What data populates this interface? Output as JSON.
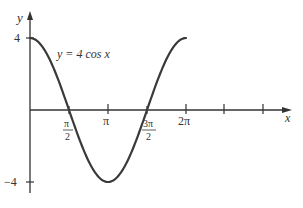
{
  "chart_data": {
    "type": "line",
    "title": "",
    "function_label": "y = 4 cos x",
    "xlabel": "x",
    "ylabel": "y",
    "xlim": [
      0,
      8.64
    ],
    "ylim": [
      -4.6,
      5.4
    ],
    "x_ticks": [
      {
        "value": 1.5708,
        "label_num": "π",
        "label_den": "2",
        "fraction": true
      },
      {
        "value": 3.1416,
        "label": "π",
        "fraction": false
      },
      {
        "value": 4.7124,
        "label_num": "3π",
        "label_den": "2",
        "fraction": true
      },
      {
        "value": 6.2832,
        "label": "2π",
        "fraction": false
      },
      {
        "value": 7.854,
        "label": "",
        "fraction": false
      },
      {
        "value": 9.4248,
        "label": "",
        "fraction": false
      }
    ],
    "y_ticks": [
      {
        "value": 4,
        "label": "4"
      },
      {
        "value": -4,
        "label": "−4"
      }
    ],
    "series": [
      {
        "name": "y = 4 cos x",
        "x_range": [
          0,
          6.2832
        ],
        "points": [
          [
            0,
            4
          ],
          [
            0.7854,
            2.83
          ],
          [
            1.5708,
            0
          ],
          [
            2.3562,
            -2.83
          ],
          [
            3.1416,
            -4
          ],
          [
            3.927,
            -2.83
          ],
          [
            4.7124,
            0
          ],
          [
            5.4978,
            2.83
          ],
          [
            6.2832,
            4
          ]
        ],
        "color": "#3a3a3a"
      }
    ],
    "grid": false,
    "legend": null
  },
  "labels": {
    "function": "y = 4 cos x",
    "x_axis": "x",
    "y_axis": "y",
    "y_tick_4": "4",
    "y_tick_neg4": "−4",
    "x_tick_pi_over_2_num": "π",
    "x_tick_pi_over_2_den": "2",
    "x_tick_pi": "π",
    "x_tick_3pi_over_2_num": "3π",
    "x_tick_3pi_over_2_den": "2",
    "x_tick_2pi": "2π"
  },
  "colors": {
    "axis": "#333333",
    "curve": "#3a3a3a",
    "text": "#333333",
    "background": "#ffffff"
  }
}
